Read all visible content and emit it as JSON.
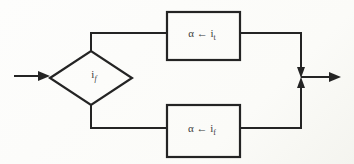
{
  "diagram": {
    "type": "flowchart",
    "background_color": "#fcfcfa",
    "line_color": "#242424",
    "decision": {
      "shape": "diamond",
      "label_base": "i",
      "label_sub": "f"
    },
    "process_top": {
      "shape": "rectangle",
      "label_base": "α ← i",
      "label_sub": "t"
    },
    "process_bottom": {
      "shape": "rectangle",
      "label_base": "α ← i",
      "label_sub": "f"
    },
    "connectors": {
      "input_arrow": "left-to-diamond",
      "merge_junction": "two converging arrowheads",
      "output_arrow": "junction-to-right"
    }
  }
}
